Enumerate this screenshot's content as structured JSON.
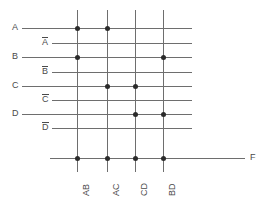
{
  "diagram": {
    "type": "pla-crossbar",
    "title": "",
    "inputs": [
      {
        "id": "A",
        "label": "A",
        "overbar": false,
        "y": 28,
        "label_x": 12,
        "line_start_x": 22,
        "line_end_x": 192
      },
      {
        "id": "An",
        "label": "A",
        "overbar": true,
        "y": 43,
        "label_x": 42,
        "line_start_x": 52,
        "line_end_x": 192
      },
      {
        "id": "B",
        "label": "B",
        "overbar": false,
        "y": 57,
        "label_x": 12,
        "line_start_x": 22,
        "line_end_x": 192
      },
      {
        "id": "Bn",
        "label": "B",
        "overbar": true,
        "y": 72,
        "label_x": 42,
        "line_start_x": 52,
        "line_end_x": 192
      },
      {
        "id": "C",
        "label": "C",
        "overbar": false,
        "y": 86,
        "label_x": 12,
        "line_start_x": 22,
        "line_end_x": 192
      },
      {
        "id": "Cn",
        "label": "C",
        "overbar": true,
        "y": 100,
        "label_x": 42,
        "line_start_x": 52,
        "line_end_x": 192
      },
      {
        "id": "D",
        "label": "D",
        "overbar": false,
        "y": 114,
        "label_x": 12,
        "line_start_x": 22,
        "line_end_x": 192
      },
      {
        "id": "Dn",
        "label": "D",
        "overbar": true,
        "y": 128,
        "label_x": 42,
        "line_start_x": 52,
        "line_end_x": 192
      }
    ],
    "products": [
      {
        "id": "AB",
        "label": "AB",
        "x": 77,
        "line_top_y": 10,
        "line_bottom_y": 172
      },
      {
        "id": "AC",
        "label": "AC",
        "x": 107,
        "line_top_y": 10,
        "line_bottom_y": 172
      },
      {
        "id": "CD",
        "label": "CD",
        "x": 135,
        "line_top_y": 10,
        "line_bottom_y": 172
      },
      {
        "id": "BD",
        "label": "BD",
        "x": 163,
        "line_top_y": 10,
        "line_bottom_y": 172
      }
    ],
    "output": {
      "label": "F",
      "y": 158,
      "line_start_x": 50,
      "line_end_x": 245,
      "label_x": 250
    },
    "connections": [
      {
        "row": "A",
        "col": "AB"
      },
      {
        "row": "A",
        "col": "AC"
      },
      {
        "row": "B",
        "col": "AB"
      },
      {
        "row": "B",
        "col": "BD"
      },
      {
        "row": "C",
        "col": "AC"
      },
      {
        "row": "C",
        "col": "CD"
      },
      {
        "row": "D",
        "col": "CD"
      },
      {
        "row": "D",
        "col": "BD"
      },
      {
        "row": "F",
        "col": "AB"
      },
      {
        "row": "F",
        "col": "AC"
      },
      {
        "row": "F",
        "col": "CD"
      },
      {
        "row": "F",
        "col": "BD"
      }
    ],
    "colors": {
      "line": "#6e6e6e",
      "dot": "#2b2b2b",
      "text": "#4a4a4a",
      "background": "#ffffff"
    }
  }
}
